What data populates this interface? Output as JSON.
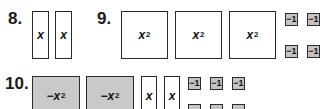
{
  "problems": [
    {
      "number": "8.",
      "tiles": [
        {
          "type": "x",
          "label": "x",
          "sign": "positive"
        },
        {
          "type": "x",
          "label": "x",
          "sign": "positive"
        }
      ]
    },
    {
      "number": "9.",
      "tiles": [
        {
          "type": "x2",
          "label": "x",
          "exp": "2",
          "sign": "positive"
        },
        {
          "type": "x2",
          "label": "x",
          "exp": "2",
          "sign": "positive"
        },
        {
          "type": "x2",
          "label": "x",
          "exp": "2",
          "sign": "positive"
        },
        {
          "type": "unit",
          "label": "−1",
          "sign": "negative"
        },
        {
          "type": "unit",
          "label": "−1",
          "sign": "negative"
        },
        {
          "type": "unit",
          "label": "−1",
          "sign": "negative"
        },
        {
          "type": "unit",
          "label": "−1",
          "sign": "negative"
        }
      ]
    },
    {
      "number": "10.",
      "tiles": [
        {
          "type": "x2",
          "label": "−x",
          "exp": "2",
          "sign": "negative"
        },
        {
          "type": "x2",
          "label": "−x",
          "exp": "2",
          "sign": "negative"
        },
        {
          "type": "x",
          "label": "x",
          "sign": "positive"
        },
        {
          "type": "x",
          "label": "x",
          "sign": "positive"
        },
        {
          "type": "unit",
          "label": "−1",
          "sign": "negative"
        },
        {
          "type": "unit",
          "label": "−1",
          "sign": "negative"
        },
        {
          "type": "unit",
          "label": "−1",
          "sign": "negative"
        }
      ]
    }
  ],
  "colors": {
    "positive_fill": "#ffffff",
    "negative_fill": "#c9c9c9",
    "border": "#2a2a2a"
  }
}
